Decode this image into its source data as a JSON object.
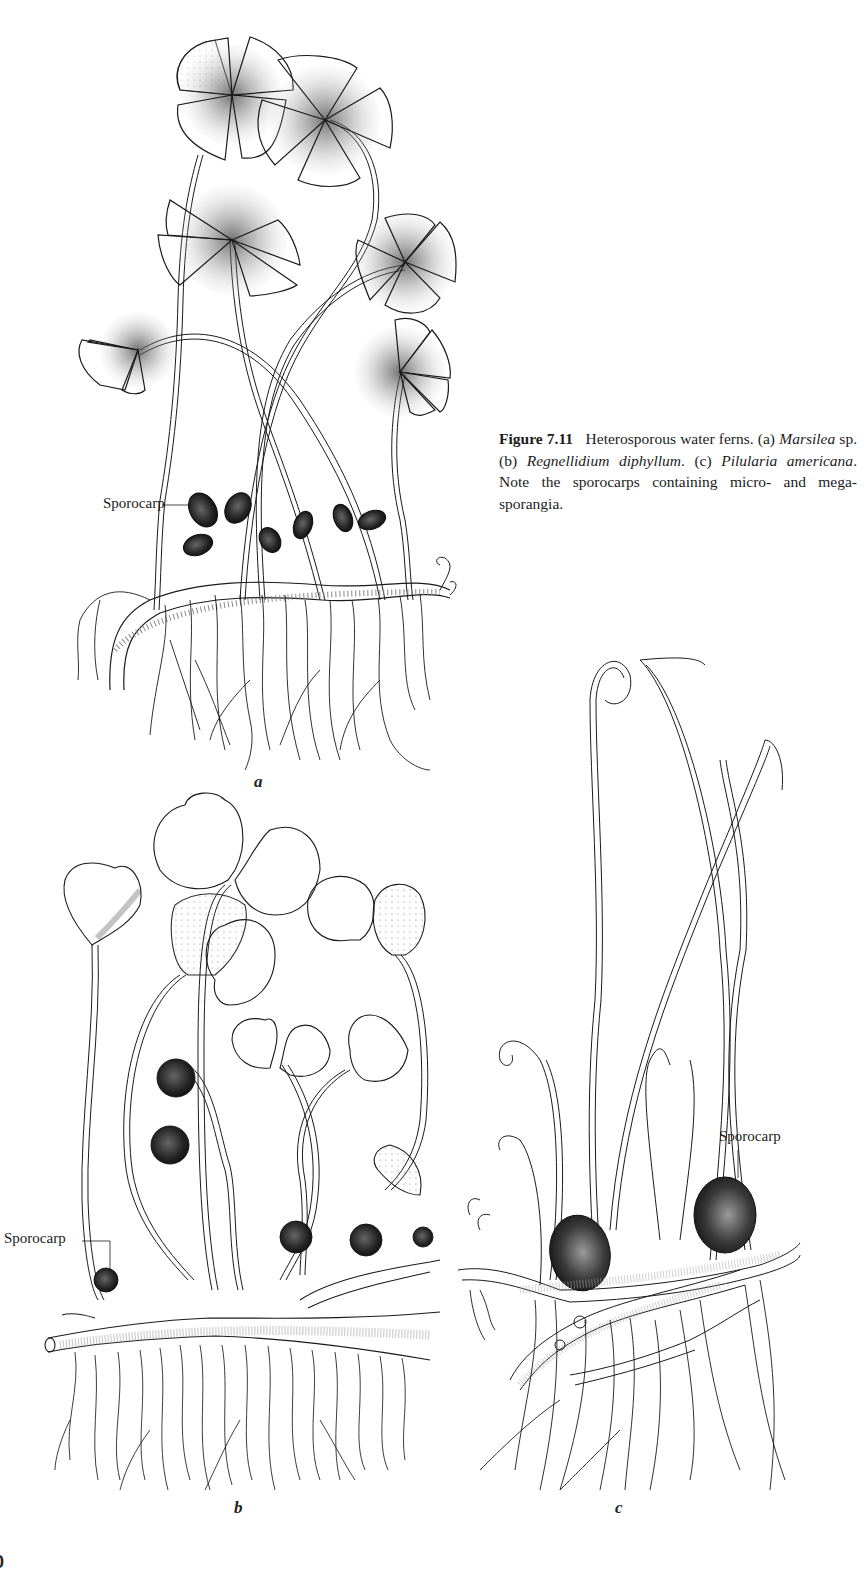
{
  "figure": {
    "number_label": "Figure 7.11",
    "caption_parts": {
      "title": "Heterosporous water ferns.",
      "a_marker": "(a)",
      "a_genus": "Marsilea",
      "a_suffix": " sp.",
      "b_marker": "(b)",
      "b_species": "Regnellidium diphyl­lum",
      "c_marker": "(c)",
      "c_species": "Pilularia americana",
      "note": "Note the sporocarps containing micro- and mega­sporangia."
    },
    "panels": [
      {
        "id": "a",
        "letter": "a",
        "subject": "Marsilea sp.",
        "callout": "Sporocarp"
      },
      {
        "id": "b",
        "letter": "b",
        "subject": "Regnellidium diphyllum",
        "callout": "Sporocarp"
      },
      {
        "id": "c",
        "letter": "c",
        "subject": "Pilularia americana",
        "callout": "Sporocarp"
      }
    ]
  },
  "page": {
    "page_number_fragment": "0"
  },
  "colors": {
    "ink": "#1a1a1a",
    "background": "#ffffff",
    "stipple": "#555555"
  }
}
